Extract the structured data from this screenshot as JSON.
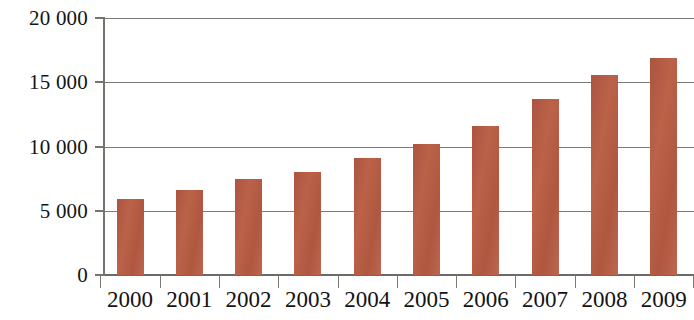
{
  "chart_data": {
    "type": "bar",
    "title": "",
    "subtitle": "",
    "xlabel": "",
    "ylabel": "",
    "categories": [
      "2000",
      "2001",
      "2002",
      "2003",
      "2004",
      "2005",
      "2006",
      "2007",
      "2008",
      "2009"
    ],
    "values": [
      5900,
      6600,
      7500,
      8000,
      9100,
      10200,
      11600,
      13700,
      15600,
      16900
    ],
    "series": [
      {
        "name": "",
        "values": [
          5900,
          6600,
          7500,
          8000,
          9100,
          10200,
          11600,
          13700,
          15600,
          16900
        ],
        "color": "#b45b44"
      }
    ],
    "ylim": [
      0,
      20000
    ],
    "y_ticks": [
      0,
      5000,
      10000,
      15000,
      20000
    ],
    "y_tick_labels": [
      "0",
      "5 000",
      "10 000",
      "15 000",
      "20 000"
    ],
    "x_tick_labels": [
      "2000",
      "2001",
      "2002",
      "2003",
      "2004",
      "2005",
      "2006",
      "2007",
      "2008",
      "2009"
    ],
    "grid": true,
    "grid_axis": "y",
    "legend": false,
    "legend_position": "none",
    "bar_color": "#b45b44",
    "grid_color": "#7d7a76",
    "axis_color": "#77736f",
    "background_color": "#ffffff",
    "annotations": []
  }
}
